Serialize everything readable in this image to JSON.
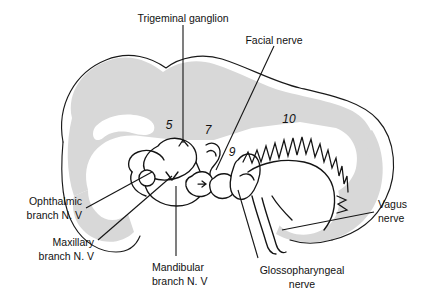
{
  "figure": {
    "title_text": "Cranial nerves of the brain (lateral view)",
    "background_color": "#ffffff",
    "outline_color": "#1a1a1a",
    "shade_color": "#d8d8d8",
    "text_color": "#111111"
  },
  "labels": {
    "trigeminal_ganglion": "Trigeminal ganglion",
    "facial_nerve": "Facial nerve",
    "vagus_nerve_line1": "Vagus",
    "vagus_nerve_line2": "nerve",
    "ophthalmic_line1": "Ophthalmic",
    "ophthalmic_line2": "branch N. V",
    "maxillary_line1": "Maxillary",
    "maxillary_line2": "branch N. V",
    "mandibular_line1": "Mandibular",
    "mandibular_line2": "branch N. V",
    "glossopharyngeal_line1": "Glossopharyngeal",
    "glossopharyngeal_line2": "nerve"
  },
  "numbers": {
    "n5": "5",
    "n7": "7",
    "n9": "9",
    "n10": "10"
  }
}
